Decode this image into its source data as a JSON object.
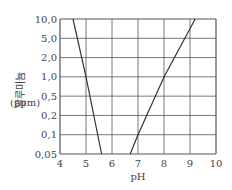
{
  "chart_data": {
    "type": "line",
    "title": "",
    "xlabel": "pH",
    "ylabel": "알루미늄 (ppm)",
    "ylabel_main": "알루미늄",
    "ylabel_unit": "(ppm)",
    "x_ticks": [
      "4",
      "5",
      "6",
      "7",
      "8",
      "9",
      "10"
    ],
    "y_ticks": [
      "10.0",
      "5.0",
      "2.0",
      "1.0",
      "0.5",
      "0.2",
      "0.1",
      "0.05"
    ],
    "xlim": [
      4,
      10
    ],
    "ylim": [
      0.05,
      10.0
    ],
    "y_scale": "log (categorical ticks)",
    "grid": true,
    "legend": null,
    "series": [
      {
        "name": "acidic-branch",
        "points": [
          [
            4.5,
            10.0
          ],
          [
            5.0,
            1.0
          ],
          [
            5.6,
            0.05
          ]
        ]
      },
      {
        "name": "alkaline-branch",
        "points": [
          [
            6.7,
            0.05
          ],
          [
            7.0,
            0.1
          ],
          [
            8.0,
            1.0
          ],
          [
            9.2,
            10.0
          ]
        ]
      }
    ]
  }
}
